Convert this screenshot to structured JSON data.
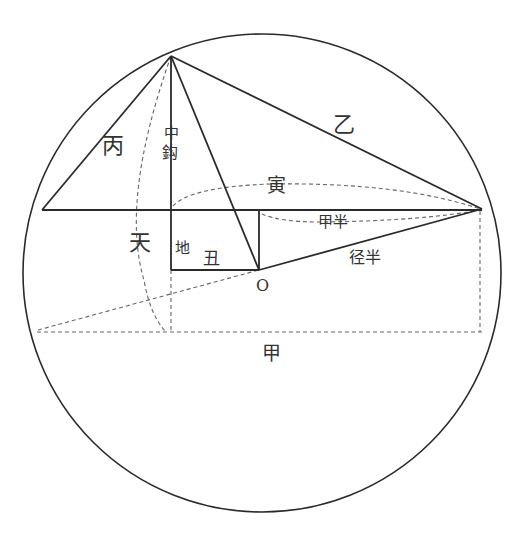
{
  "diagram": {
    "type": "geometric-construction",
    "colors": {
      "line": "#2a2a2a",
      "dashed": "#666666",
      "text": "#333333",
      "background": "#ffffff"
    },
    "circle": {
      "cx": 262,
      "cy": 273,
      "r": 239
    },
    "points": {
      "apex": {
        "x": 171,
        "y": 56
      },
      "left_chord_end": {
        "x": 42,
        "y": 210
      },
      "right_chord_end": {
        "x": 482,
        "y": 209
      },
      "foot": {
        "x": 171,
        "y": 210
      },
      "rect_top_right": {
        "x": 259,
        "y": 210
      },
      "rect_bottom_left": {
        "x": 171,
        "y": 270
      },
      "O": {
        "x": 259,
        "y": 270
      }
    },
    "labels": {
      "bing": "丙",
      "yi": "乙",
      "zhonggou_1": "中",
      "zhonggou_2": "鈎",
      "yin": "寅",
      "tian": "天",
      "di": "地",
      "chou": "丑",
      "jiaban": "甲半",
      "jingban": "径半",
      "o": "O",
      "jia": "甲"
    }
  }
}
